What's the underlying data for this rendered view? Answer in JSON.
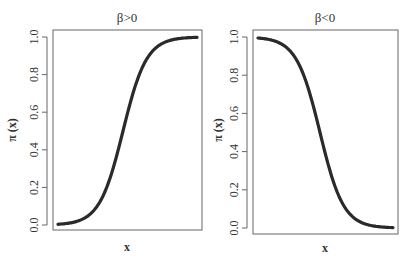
{
  "chart_data": [
    {
      "type": "line",
      "title": "β>0",
      "xlabel": "x",
      "ylabel": "π (x)",
      "ylim": [
        0,
        1
      ],
      "yticks": [
        "0.0",
        "0.2",
        "0.4",
        "0.6",
        "0.8",
        "1.0"
      ],
      "xticks": [],
      "grid": false,
      "curve": "logistic increasing",
      "x": [
        -4,
        -3,
        -2,
        -1.5,
        -1,
        -0.5,
        0,
        0.5,
        1,
        1.5,
        2,
        3,
        4
      ],
      "values": [
        0.0,
        0.01,
        0.05,
        0.1,
        0.2,
        0.35,
        0.5,
        0.65,
        0.8,
        0.9,
        0.95,
        0.99,
        1.0
      ]
    },
    {
      "type": "line",
      "title": "β<0",
      "xlabel": "x",
      "ylabel": "π (x)",
      "ylim": [
        0,
        1
      ],
      "yticks": [
        "0.0",
        "0.2",
        "0.4",
        "0.6",
        "0.8",
        "1.0"
      ],
      "xticks": [],
      "grid": false,
      "curve": "logistic decreasing",
      "x": [
        -4,
        -3,
        -2,
        -1.5,
        -1,
        -0.5,
        0,
        0.5,
        1,
        1.5,
        2,
        3,
        4
      ],
      "values": [
        1.0,
        0.99,
        0.95,
        0.9,
        0.8,
        0.65,
        0.5,
        0.35,
        0.2,
        0.1,
        0.05,
        0.01,
        0.0
      ]
    }
  ],
  "panels": [
    {
      "title": "β>0",
      "xlabel": "x",
      "ylabel": "π (x)"
    },
    {
      "title": "β<0",
      "xlabel": "x",
      "ylabel": "π (x)"
    }
  ],
  "style": {
    "line_color": "#2a2a2a",
    "frame_color": "#555555"
  }
}
